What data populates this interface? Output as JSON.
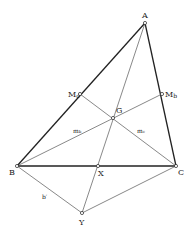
{
  "diagram": {
    "points": {
      "A": {
        "label": "A",
        "x": 145,
        "y": 23
      },
      "B": {
        "label": "B",
        "x": 17,
        "y": 166
      },
      "C": {
        "label": "C",
        "x": 176,
        "y": 166
      },
      "Mc": {
        "label": "M",
        "sub": "c",
        "x": 80,
        "y": 94
      },
      "Mb": {
        "label": "M",
        "sub": "b",
        "x": 162,
        "y": 94
      },
      "G": {
        "label": "G",
        "x": 113,
        "y": 118
      },
      "X": {
        "label": "X",
        "x": 98,
        "y": 166
      },
      "Y": {
        "label": "Y",
        "x": 82,
        "y": 213
      }
    },
    "segment_labels": {
      "mb": "m",
      "mb_sub": "b",
      "mc": "m",
      "mc_sub": "c",
      "bprime": "b′"
    },
    "colors": {
      "thick": "#222222",
      "thin": "#555555"
    }
  }
}
